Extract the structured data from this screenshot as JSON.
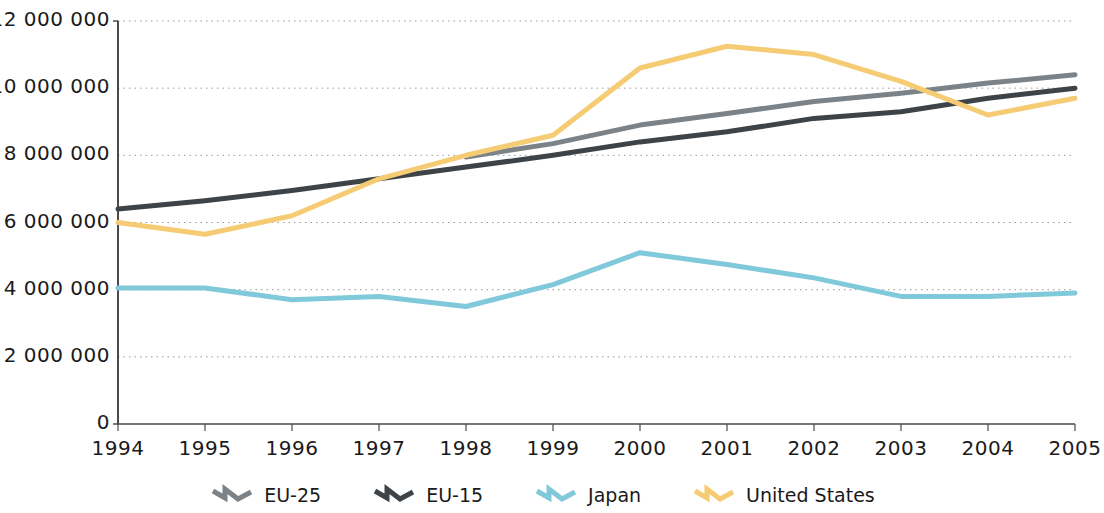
{
  "chart_data": {
    "type": "line",
    "title": "",
    "subtitle": "",
    "xlabel": "",
    "ylabel": "",
    "categories": [
      "1994",
      "1995",
      "1996",
      "1997",
      "1998",
      "1999",
      "2000",
      "2001",
      "2002",
      "2003",
      "2004",
      "2005"
    ],
    "x": [
      1994,
      1995,
      1996,
      1997,
      1998,
      1999,
      2000,
      2001,
      2002,
      2003,
      2004,
      2005
    ],
    "xlim": [
      1994,
      2005
    ],
    "ylim": [
      0,
      12000000
    ],
    "y_ticks": [
      0,
      2000000,
      4000000,
      6000000,
      8000000,
      10000000,
      12000000
    ],
    "y_tick_labels": [
      "0",
      "2 000 000",
      "4 000 000",
      "6 000 000",
      "8 000 000",
      "10 000 000",
      "12 000 000"
    ],
    "grid": "horizontal-dotted",
    "legend_position": "bottom",
    "series": [
      {
        "name": "EU-25",
        "color": "#7b8389",
        "values": [
          null,
          null,
          null,
          null,
          7950000,
          8350000,
          8900000,
          9250000,
          9600000,
          9850000,
          10150000,
          10400000
        ]
      },
      {
        "name": "EU-15",
        "color": "#3e4347",
        "values": [
          6400000,
          6650000,
          6950000,
          7300000,
          7650000,
          8000000,
          8400000,
          8700000,
          9100000,
          9300000,
          9700000,
          10000000
        ]
      },
      {
        "name": "Japan",
        "color": "#7fc9da",
        "values": [
          4050000,
          4050000,
          3700000,
          3800000,
          3500000,
          4150000,
          5100000,
          4750000,
          4350000,
          3800000,
          3800000,
          3900000
        ]
      },
      {
        "name": "United States",
        "color": "#f5cc74",
        "values": [
          6000000,
          5650000,
          6200000,
          7300000,
          8000000,
          8600000,
          10600000,
          11250000,
          11000000,
          10200000,
          9200000,
          9700000
        ]
      }
    ]
  },
  "axes": {
    "y_tick_labels": [
      "12 000 000",
      "10 000 000",
      "8 000 000",
      "6 000 000",
      "4 000 000",
      "2 000 000",
      "0"
    ],
    "x_tick_labels": [
      "1994",
      "1995",
      "1996",
      "1997",
      "1998",
      "1999",
      "2000",
      "2001",
      "2002",
      "2003",
      "2004",
      "2005"
    ]
  },
  "legend": {
    "items": [
      {
        "label": "EU-25",
        "color": "#7b8389",
        "icon": "zigzag-line-icon"
      },
      {
        "label": "EU-15",
        "color": "#3e4347",
        "icon": "zigzag-line-icon"
      },
      {
        "label": "Japan",
        "color": "#7fc9da",
        "icon": "zigzag-line-icon"
      },
      {
        "label": "United States",
        "color": "#f5cc74",
        "icon": "zigzag-line-icon"
      }
    ]
  },
  "colors": {
    "axis": "#4a4a4a",
    "grid": "#9a9a9a",
    "text": "#1a1a1a",
    "background": "#ffffff"
  }
}
